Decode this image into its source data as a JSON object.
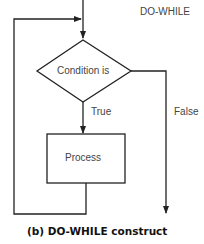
{
  "diagram": {
    "title": "DO-WHILE",
    "decision": {
      "label": "Condition is"
    },
    "process": {
      "label": "Process"
    },
    "branches": {
      "true_label": "True",
      "false_label": "False"
    },
    "caption": "(b) DO-WHILE construct",
    "colors": {
      "line": "#222222",
      "box_fill": "#ffffff",
      "text": "#444444"
    }
  }
}
